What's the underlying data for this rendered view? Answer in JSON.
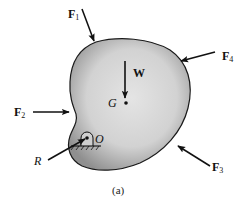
{
  "figure": {
    "caption": "(a)",
    "body": {
      "fill_center": "#e2e2e2",
      "fill_edge": "#9a9a9a",
      "outline": "#1a1a1a"
    },
    "center_of_gravity": {
      "label": "G"
    },
    "pivot": {
      "label": "O"
    },
    "forces": [
      {
        "id": "F1",
        "base": "F",
        "sub": "1"
      },
      {
        "id": "F2",
        "base": "F",
        "sub": "2"
      },
      {
        "id": "F3",
        "base": "F",
        "sub": "3"
      },
      {
        "id": "F4",
        "base": "F",
        "sub": "4"
      },
      {
        "id": "W",
        "base": "W",
        "sub": ""
      },
      {
        "id": "R",
        "base": "R",
        "sub": ""
      }
    ]
  }
}
